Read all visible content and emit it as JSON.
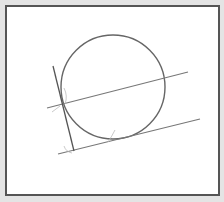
{
  "diagram": {
    "title": "",
    "colors": {
      "background": "#e4e4e4",
      "frame_border": "#555555",
      "stroke": "#666666",
      "construction": "#b0b0b0"
    },
    "circle": {
      "cx": 113,
      "cy": 87,
      "r": 52
    },
    "lines": [
      {
        "name": "secant-line",
        "x1": 47,
        "y1": 108,
        "x2": 188,
        "y2": 72
      },
      {
        "name": "tangent-line",
        "x1": 58,
        "y1": 154,
        "x2": 200,
        "y2": 119
      },
      {
        "name": "perpendicular-line",
        "x1": 53,
        "y1": 66,
        "x2": 74,
        "y2": 151
      }
    ]
  }
}
